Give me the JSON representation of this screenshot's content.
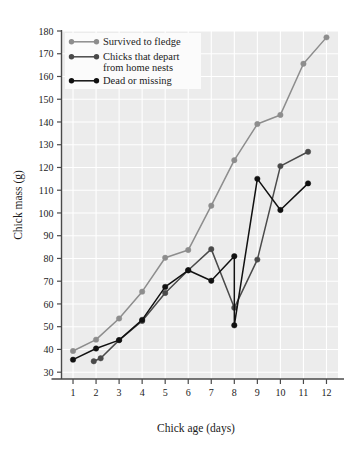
{
  "chart_data": {
    "type": "line",
    "title": "",
    "xlabel": "Chick age (days)",
    "ylabel": "Chick mass (g)",
    "xlim": [
      0.5,
      12.5
    ],
    "ylim": [
      27,
      180
    ],
    "xticks": [
      1,
      2,
      3,
      4,
      5,
      6,
      7,
      8,
      9,
      10,
      11,
      12
    ],
    "yticks": [
      30,
      40,
      50,
      60,
      70,
      80,
      90,
      100,
      110,
      120,
      130,
      140,
      150,
      160,
      170,
      180
    ],
    "grid": true,
    "grid_color": "#ffffff",
    "plot_background": "#ececec",
    "legend_position": "top-left",
    "series": [
      {
        "name": "Survived to fledge",
        "color": "#8d8d8d",
        "marker": "circle",
        "x": [
          1,
          2,
          3,
          4,
          5,
          6,
          7,
          8,
          9,
          10,
          11,
          12
        ],
        "values": [
          39.3,
          44.3,
          53.6,
          65.4,
          80.3,
          83.7,
          103.2,
          123.2,
          139.1,
          143.1,
          165.6,
          177.2
        ]
      },
      {
        "name": "Chicks that depart from home nests",
        "color": "#4a4a4a",
        "marker": "circle",
        "x": [
          1.9,
          2.2,
          3,
          4,
          5,
          6,
          7,
          8,
          9,
          10,
          11.2
        ],
        "values": [
          34.8,
          36.1,
          44.1,
          52.5,
          64.8,
          74.8,
          84.1,
          58.3,
          79.5,
          120.6,
          126.9
        ]
      },
      {
        "name": "Dead or missing",
        "color": "#111111",
        "marker": "circle",
        "x": [
          1,
          2,
          3,
          4,
          5,
          6,
          7,
          8,
          8,
          9,
          10,
          11.2
        ],
        "values": [
          35.5,
          40.4,
          44.1,
          53.0,
          67.5,
          74.8,
          70.2,
          81.0,
          50.6,
          115.0,
          101.3,
          113.0
        ]
      }
    ]
  },
  "legend": {
    "entries": [
      {
        "label": "Survived to fledge"
      },
      {
        "label": "Chicks that depart"
      },
      {
        "label": "from home nests"
      },
      {
        "label": "Dead or missing"
      }
    ]
  }
}
